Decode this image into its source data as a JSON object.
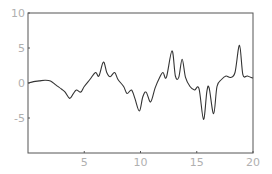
{
  "chart_data": {
    "type": "line",
    "title": "",
    "xlabel": "",
    "ylabel": "",
    "xlim": [
      0,
      20
    ],
    "ylim": [
      -10,
      10
    ],
    "grid": false,
    "legend": null,
    "x_ticks": [
      5,
      10,
      15,
      20
    ],
    "x_tick_labels": [
      "5",
      "10",
      "15",
      "20"
    ],
    "y_ticks": [
      10,
      5,
      0,
      -5
    ],
    "y_tick_labels": [
      "10",
      "5",
      "0",
      "-5"
    ],
    "colors": {
      "line": "#333333",
      "frame": "#555555",
      "tick_text": "#b0b0b0"
    },
    "series": [
      {
        "name": "f(x)",
        "points": [
          [
            0.0,
            0.0
          ],
          [
            0.5,
            0.2
          ],
          [
            1.0,
            0.3
          ],
          [
            1.5,
            0.4
          ],
          [
            2.0,
            0.3
          ],
          [
            2.5,
            -0.3
          ],
          [
            3.0,
            -0.9
          ],
          [
            3.3,
            -1.3
          ],
          [
            3.7,
            -2.2
          ],
          [
            4.0,
            -1.6
          ],
          [
            4.3,
            -1.0
          ],
          [
            4.7,
            -1.3
          ],
          [
            5.0,
            -0.5
          ],
          [
            5.5,
            0.5
          ],
          [
            6.0,
            1.5
          ],
          [
            6.3,
            1.0
          ],
          [
            6.7,
            3.0
          ],
          [
            7.0,
            1.5
          ],
          [
            7.3,
            0.9
          ],
          [
            7.7,
            1.5
          ],
          [
            8.0,
            0.5
          ],
          [
            8.5,
            -0.5
          ],
          [
            8.8,
            -1.5
          ],
          [
            9.2,
            -1.0
          ],
          [
            9.5,
            -2.2
          ],
          [
            9.9,
            -4.0
          ],
          [
            10.2,
            -2.0
          ],
          [
            10.5,
            -1.3
          ],
          [
            10.9,
            -2.7
          ],
          [
            11.3,
            -0.7
          ],
          [
            11.7,
            0.8
          ],
          [
            12.0,
            1.5
          ],
          [
            12.3,
            0.8
          ],
          [
            12.8,
            4.6
          ],
          [
            13.1,
            1.0
          ],
          [
            13.4,
            0.8
          ],
          [
            13.7,
            3.4
          ],
          [
            14.0,
            0.8
          ],
          [
            14.4,
            -0.5
          ],
          [
            14.8,
            -1.0
          ],
          [
            15.2,
            -0.8
          ],
          [
            15.6,
            -5.2
          ],
          [
            15.9,
            -1.2
          ],
          [
            16.1,
            -0.7
          ],
          [
            16.5,
            -4.4
          ],
          [
            16.8,
            -0.5
          ],
          [
            17.2,
            0.5
          ],
          [
            17.6,
            1.0
          ],
          [
            18.0,
            0.8
          ],
          [
            18.4,
            1.5
          ],
          [
            18.8,
            5.4
          ],
          [
            19.1,
            1.2
          ],
          [
            19.5,
            1.0
          ],
          [
            20.0,
            0.7
          ]
        ]
      }
    ]
  }
}
